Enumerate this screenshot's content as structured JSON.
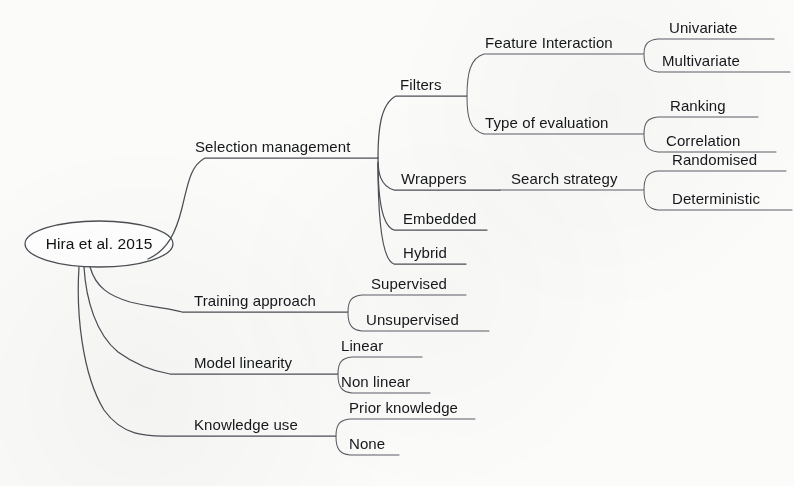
{
  "diagram": {
    "type": "mind-map",
    "orientation": "left-to-right",
    "root": {
      "label": "Hira et al. 2015",
      "shape": "ellipse"
    },
    "branches": [
      {
        "label": "Selection management",
        "children": [
          {
            "label": "Filters",
            "children": [
              {
                "label": "Feature Interaction",
                "children": [
                  {
                    "label": "Univariate"
                  },
                  {
                    "label": "Multivariate"
                  }
                ]
              },
              {
                "label": "Type of evaluation",
                "children": [
                  {
                    "label": "Ranking"
                  },
                  {
                    "label": "Correlation"
                  }
                ]
              }
            ]
          },
          {
            "label": "Wrappers",
            "children": [
              {
                "label": "Search strategy",
                "children": [
                  {
                    "label": "Randomised"
                  },
                  {
                    "label": "Deterministic"
                  }
                ]
              }
            ]
          },
          {
            "label": "Embedded"
          },
          {
            "label": "Hybrid"
          }
        ]
      },
      {
        "label": "Training approach",
        "children": [
          {
            "label": "Supervised"
          },
          {
            "label": "Unsupervised"
          }
        ]
      },
      {
        "label": "Model linearity",
        "children": [
          {
            "label": "Linear"
          },
          {
            "label": "Non linear"
          }
        ]
      },
      {
        "label": "Knowledge use",
        "children": [
          {
            "label": "Prior knowledge"
          },
          {
            "label": "None"
          }
        ]
      }
    ]
  },
  "colors": {
    "background": "#fbfbfa",
    "stroke": "#4b4f55",
    "text": "#15171a"
  },
  "labels": {
    "root": "Hira et al. 2015",
    "selection_management": "Selection management",
    "filters": "Filters",
    "feature_interaction": "Feature Interaction",
    "univariate": "Univariate",
    "multivariate": "Multivariate",
    "type_of_evaluation": "Type of evaluation",
    "ranking": "Ranking",
    "correlation": "Correlation",
    "wrappers": "Wrappers",
    "search_strategy": "Search strategy",
    "randomised": "Randomised",
    "deterministic": "Deterministic",
    "embedded": "Embedded",
    "hybrid": "Hybrid",
    "training_approach": "Training approach",
    "supervised": "Supervised",
    "unsupervised": "Unsupervised",
    "model_linearity": "Model linearity",
    "linear": "Linear",
    "non_linear": "Non linear",
    "knowledge_use": "Knowledge use",
    "prior_knowledge": "Prior knowledge",
    "none": "None"
  }
}
